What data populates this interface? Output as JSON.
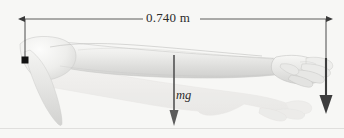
{
  "figure": {
    "background_color": "#f7f7f5",
    "width": 344,
    "height": 138,
    "annotations": {
      "dimension_label": "0.740 m",
      "weight_label": "mg"
    },
    "measurements": {
      "arm_length_value": 0.74,
      "arm_length_unit": "m",
      "dimension_line_y": 19,
      "dimension_start_x": 25,
      "dimension_end_x": 326
    },
    "colors": {
      "line": "#4a4a4a",
      "text": "#2b2b2b",
      "arrow_weight": "#5b5b5b",
      "arrow_force": "#3d3d3d",
      "skin_light": "#f2f2f0",
      "skin_mid": "#dcdcda",
      "skin_shadow": "#c8c8c6",
      "ghost": "#ecebe9",
      "baseline": "#e0dfdd"
    },
    "markers": {
      "pivot_label": "pivot-point",
      "pivot_x": 25,
      "pivot_y": 60
    },
    "vectors": [
      {
        "name": "weight-vector",
        "label": "mg",
        "x": 174,
        "y_start": 55,
        "y_end": 124,
        "direction": "down"
      },
      {
        "name": "hand-force-vector",
        "label": "",
        "x": 326,
        "y_start": 58,
        "y_end": 112,
        "direction": "down"
      }
    ],
    "subject": {
      "name": "outstretched-arm-illustration",
      "description": "human arm extended horizontally with hand at right"
    }
  }
}
